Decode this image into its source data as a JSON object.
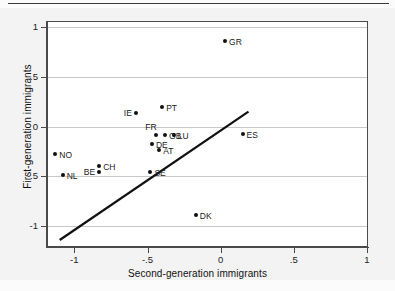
{
  "figure": {
    "has_top_rule": true,
    "background": "#f3f3f3",
    "plot_background": "#ffffff"
  },
  "chart_data": {
    "type": "scatter",
    "title": "",
    "xlabel": "Second-generation immigrants",
    "ylabel": "First-generation immigrants",
    "xlim": [
      -1.18,
      1.0
    ],
    "ylim": [
      -1.2,
      1.05
    ],
    "xticks": [
      -1,
      -0.5,
      0,
      0.5,
      1
    ],
    "xticklabels": [
      "-1",
      "-.5",
      "0",
      ".5",
      "1"
    ],
    "yticks": [
      -1,
      -0.5,
      0,
      0.5,
      1
    ],
    "yticklabels": [
      "-1",
      "-.5",
      "0",
      ".5",
      "1"
    ],
    "grid": "horizontal",
    "legend": "none",
    "points": [
      {
        "label": "GR",
        "x": 0.03,
        "y": 0.86,
        "label_side": "right"
      },
      {
        "label": "PT",
        "x": -0.4,
        "y": 0.2,
        "label_side": "right"
      },
      {
        "label": "IE",
        "x": -0.58,
        "y": 0.14,
        "label_side": "left"
      },
      {
        "label": "FR",
        "x": -0.44,
        "y": -0.09,
        "label_side": "above-left"
      },
      {
        "label": "GB",
        "x": -0.38,
        "y": -0.09,
        "label_side": "right"
      },
      {
        "label": "LU",
        "x": -0.32,
        "y": -0.09,
        "label_side": "right"
      },
      {
        "label": "ES",
        "x": 0.15,
        "y": -0.08,
        "label_side": "right"
      },
      {
        "label": "DE",
        "x": -0.47,
        "y": -0.18,
        "label_side": "right"
      },
      {
        "label": "AT",
        "x": -0.42,
        "y": -0.24,
        "label_side": "right"
      },
      {
        "label": "NO",
        "x": -1.13,
        "y": -0.28,
        "label_side": "right"
      },
      {
        "label": "CH",
        "x": -0.83,
        "y": -0.4,
        "label_side": "right"
      },
      {
        "label": "BE",
        "x": -0.83,
        "y": -0.46,
        "label_side": "left"
      },
      {
        "label": "SE",
        "x": -0.48,
        "y": -0.46,
        "label_side": "right"
      },
      {
        "label": "NL",
        "x": -1.08,
        "y": -0.49,
        "label_side": "right"
      },
      {
        "label": "DK",
        "x": -0.17,
        "y": -0.89,
        "label_side": "right"
      }
    ],
    "reference_line": {
      "name": "45-degree-line",
      "x0": -1.1,
      "y0": -1.14,
      "x1": 0.19,
      "y1": 0.15,
      "color": "#111111",
      "width": 2.2
    }
  }
}
